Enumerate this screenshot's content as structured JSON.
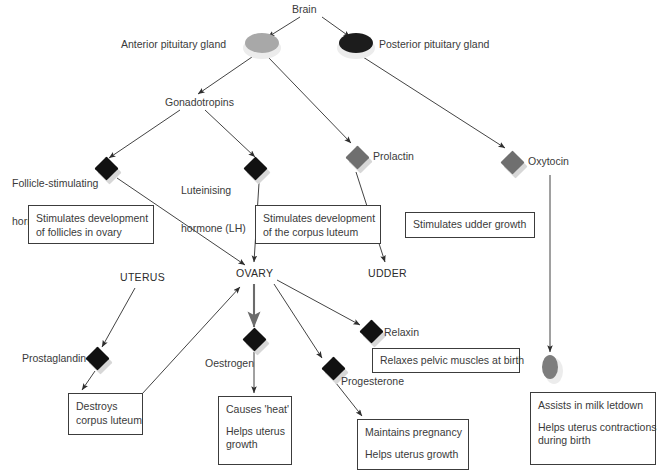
{
  "diagram": {
    "colors": {
      "text": "#3a3a3a",
      "line": "#3c3c3c",
      "diamond_dark": "#111111",
      "diamond_grey": "#6f6f6f",
      "gland_grey": "#a8a8a8",
      "gland_dark": "#1c1c1c",
      "shadow": "#d7d7d7"
    },
    "nodes": {
      "brain": "Brain",
      "anterior_pituitary": "Anterior pituitary gland",
      "posterior_pituitary": "Posterior pituitary gland",
      "gonadotropins": "Gonadotropins",
      "fsh_line1": "Follicle-stimulating",
      "fsh_line2": "hormone (FSH)",
      "lh_line1": "Luteinising",
      "lh_line2": "hormone (LH)",
      "prolactin": "Prolactin",
      "oxytocin": "Oxytocin",
      "uterus": "UTERUS",
      "ovary": "OVARY",
      "udder": "UDDER",
      "prostaglandin": "Prostaglandin",
      "oestrogen": "Oestrogen",
      "relaxin": "Relaxin",
      "progesterone": "Progesterone"
    },
    "boxes": {
      "fsh_effect": [
        "Stimulates development",
        "of follicles in ovary"
      ],
      "lh_effect": [
        "Stimulates development",
        "of the corpus luteum"
      ],
      "prolactin_effect": [
        "Stimulates udder growth"
      ],
      "prostaglandin_effect": [
        "Destroys",
        "corpus luteum"
      ],
      "oestrogen_effect_a": [
        "Causes 'heat'"
      ],
      "oestrogen_effect_b": [
        "Helps uterus",
        "growth"
      ],
      "relaxin_effect": [
        "Relaxes pelvic muscles at birth"
      ],
      "progesterone_effect_a": [
        "Maintains pregnancy"
      ],
      "progesterone_effect_b": [
        "Helps uterus growth"
      ],
      "oxytocin_effect_a": [
        "Assists in milk letdown"
      ],
      "oxytocin_effect_b": [
        "Helps uterus contractions",
        "during birth"
      ]
    },
    "edges": [
      {
        "from": "brain",
        "to": "anterior-pituitary"
      },
      {
        "from": "brain",
        "to": "posterior-pituitary"
      },
      {
        "from": "anterior-pituitary",
        "to": "gonadotropins"
      },
      {
        "from": "anterior-pituitary",
        "to": "prolactin"
      },
      {
        "from": "posterior-pituitary",
        "to": "oxytocin"
      },
      {
        "from": "gonadotropins",
        "to": "fsh"
      },
      {
        "from": "gonadotropins",
        "to": "lh"
      },
      {
        "from": "fsh",
        "to": "ovary"
      },
      {
        "from": "lh",
        "to": "ovary"
      },
      {
        "from": "prolactin",
        "to": "udder"
      },
      {
        "from": "oxytocin",
        "to": "oxytocin-gland"
      },
      {
        "from": "uterus",
        "to": "prostaglandin"
      },
      {
        "from": "prostaglandin",
        "to": "destroys-corpus-luteum-box"
      },
      {
        "from": "destroys-corpus-luteum-box",
        "to": "ovary"
      },
      {
        "from": "ovary",
        "to": "oestrogen"
      },
      {
        "from": "oestrogen",
        "to": "causes-heat-box"
      },
      {
        "from": "ovary",
        "to": "relaxin"
      },
      {
        "from": "ovary",
        "to": "progesterone"
      },
      {
        "from": "progesterone",
        "to": "maintains-pregnancy-box"
      }
    ]
  }
}
